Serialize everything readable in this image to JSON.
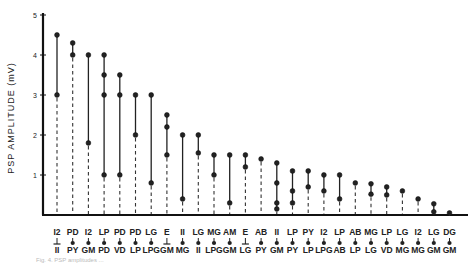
{
  "chart_data": {
    "type": "scatter",
    "title": "",
    "ylabel": "PSP AMPLITUDE (mV)",
    "xlabel": "",
    "ylim": [
      0,
      5
    ],
    "yticks": [
      1,
      2,
      3,
      4,
      5
    ],
    "grid": false,
    "legend": null,
    "style": "dot-range plot; each synapse column shows dots at measured amplitudes joined by solid line, dashed drop-line to baseline",
    "categories": [
      {
        "pre": "I2",
        "post": "II",
        "symbol": "bar",
        "values": [
          4.5,
          3.0
        ]
      },
      {
        "pre": "PD",
        "post": "PY",
        "symbol": "dot",
        "values": [
          4.3,
          4.0
        ]
      },
      {
        "pre": "I2",
        "post": "GM",
        "symbol": "dot",
        "values": [
          4.0,
          1.8
        ]
      },
      {
        "pre": "LP",
        "post": "PD",
        "symbol": "dot",
        "values": [
          4.0,
          3.5,
          3.0,
          1.0
        ]
      },
      {
        "pre": "PD",
        "post": "VD",
        "symbol": "dot",
        "values": [
          3.5,
          3.0,
          1.0
        ]
      },
      {
        "pre": "PD",
        "post": "LP",
        "symbol": "dot",
        "values": [
          3.0,
          2.0
        ]
      },
      {
        "pre": "LG",
        "post": "LPG",
        "symbol": "dot",
        "values": [
          3.0,
          0.8
        ]
      },
      {
        "pre": "E",
        "post": "GM",
        "symbol": "bar",
        "values": [
          2.5,
          2.2,
          1.5
        ]
      },
      {
        "pre": "II",
        "post": "MG",
        "symbol": "dot",
        "values": [
          2.0,
          0.4
        ]
      },
      {
        "pre": "LG",
        "post": "II",
        "symbol": "dot",
        "values": [
          2.0,
          1.55
        ]
      },
      {
        "pre": "MG",
        "post": "LPG",
        "symbol": "dot",
        "values": [
          1.5,
          1.0
        ]
      },
      {
        "pre": "AM",
        "post": "GM",
        "symbol": "dot",
        "values": [
          1.5,
          0.3
        ]
      },
      {
        "pre": "E",
        "post": "LG",
        "symbol": "bar",
        "values": [
          1.5,
          1.2
        ]
      },
      {
        "pre": "AB",
        "post": "PY",
        "symbol": "dot",
        "values": [
          1.4
        ]
      },
      {
        "pre": "II",
        "post": "GM",
        "symbol": "dot",
        "values": [
          1.3,
          0.8,
          0.3,
          0.15
        ]
      },
      {
        "pre": "LP",
        "post": "PY",
        "symbol": "dot",
        "values": [
          1.1,
          0.6,
          0.3
        ]
      },
      {
        "pre": "PY",
        "post": "LP",
        "symbol": "dot",
        "values": [
          1.1,
          0.7
        ]
      },
      {
        "pre": "I2",
        "post": "LPG",
        "symbol": "dot",
        "values": [
          1.0,
          0.6
        ]
      },
      {
        "pre": "LP",
        "post": "AB",
        "symbol": "dot",
        "values": [
          1.0,
          0.4
        ]
      },
      {
        "pre": "AB",
        "post": "LP",
        "symbol": "dot",
        "values": [
          0.8
        ]
      },
      {
        "pre": "MG",
        "post": "LG",
        "symbol": "dot",
        "values": [
          0.78,
          0.52
        ]
      },
      {
        "pre": "LP",
        "post": "VD",
        "symbol": "dot",
        "values": [
          0.7,
          0.5
        ]
      },
      {
        "pre": "LG",
        "post": "MG",
        "symbol": "dot",
        "values": [
          0.6
        ]
      },
      {
        "pre": "I2",
        "post": "MG",
        "symbol": "dot",
        "values": [
          0.4
        ]
      },
      {
        "pre": "LG",
        "post": "GM",
        "symbol": "dot",
        "values": [
          0.28,
          0.08
        ]
      },
      {
        "pre": "DG",
        "post": "GM",
        "symbol": "dot",
        "values": [
          0.05
        ]
      }
    ]
  },
  "caption": "Fig. 4. PSP amplitudes ..."
}
